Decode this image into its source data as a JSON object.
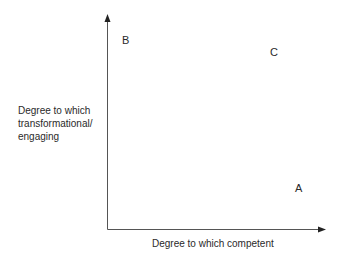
{
  "diagram": {
    "type": "2x2 positioning matrix (unlabeled quadrants)",
    "y_axis": {
      "label_lines": [
        "Degree to which",
        "transformational/",
        "engaging"
      ]
    },
    "x_axis": {
      "label": "Degree to which competent"
    },
    "points": [
      {
        "id": "B",
        "label": "B",
        "position": "high transformational, low competence"
      },
      {
        "id": "C",
        "label": "C",
        "position": "high transformational, high competence"
      },
      {
        "id": "A",
        "label": "A",
        "position": "low transformational, high competence"
      }
    ],
    "colors": {
      "axis": "#555555",
      "text": "#2a2a2a",
      "background": "#ffffff"
    }
  }
}
